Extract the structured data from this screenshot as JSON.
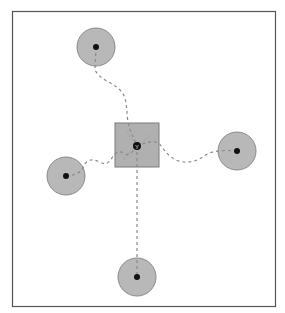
{
  "caption": "",
  "colors": {
    "frame": "#555555",
    "node_fill": "#b8b8b8",
    "node_stroke": "#8a8a8a",
    "hub_fill": "#b0b0b0",
    "hub_stroke": "#7a7a7a",
    "dot": "#111111",
    "path": "#8a8a8a"
  },
  "diagram": {
    "frame": {
      "x": 12,
      "y": 11,
      "width": 263,
      "height": 295
    },
    "hub": {
      "id": "hub",
      "shape": "square",
      "x": 115,
      "y": 123,
      "size": 44,
      "center": [
        137,
        146
      ],
      "glyph": "Y"
    },
    "nodes": [
      {
        "id": "node-top",
        "shape": "circle",
        "cx": 96,
        "cy": 47,
        "r": 19
      },
      {
        "id": "node-right",
        "shape": "circle",
        "cx": 237,
        "cy": 151,
        "r": 19
      },
      {
        "id": "node-left",
        "shape": "circle",
        "cx": 66,
        "cy": 176,
        "r": 19
      },
      {
        "id": "node-bottom",
        "shape": "circle",
        "cx": 137,
        "cy": 277,
        "r": 19
      }
    ],
    "edges": [
      {
        "from": "node-top",
        "to": "hub",
        "style": "dashed"
      },
      {
        "from": "node-right",
        "to": "hub",
        "style": "dashed"
      },
      {
        "from": "node-left",
        "to": "hub",
        "style": "dashed"
      },
      {
        "from": "node-bottom",
        "to": "hub",
        "style": "dashed"
      }
    ]
  }
}
